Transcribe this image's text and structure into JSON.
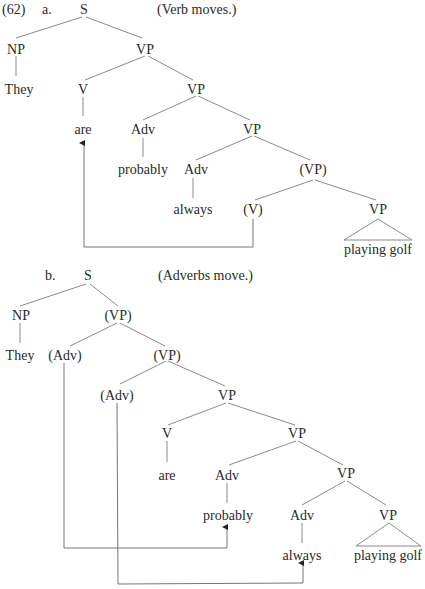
{
  "example_number": "(62)",
  "trees": [
    {
      "label": "a.",
      "caption": "(Verb moves.)",
      "nodes": {
        "S": "S",
        "NP": "NP",
        "They": "They",
        "VP1": "VP",
        "V": "V",
        "are": "are",
        "VP2": "VP",
        "Adv1": "Adv",
        "probably": "probably",
        "VP3": "VP",
        "Adv2": "Adv",
        "always": "always",
        "VP4": "(VP)",
        "Vtrace": "(V)",
        "VP5": "VP",
        "playing_golf": "playing golf"
      },
      "movements": [
        {
          "from": "(V)",
          "to": "are"
        }
      ]
    },
    {
      "label": "b.",
      "caption": "(Adverbs move.)",
      "nodes": {
        "S": "S",
        "NP": "NP",
        "They": "They",
        "VP1": "(VP)",
        "AdvTrace1": "(Adv)",
        "VP2": "(VP)",
        "AdvTrace2": "(Adv)",
        "VP3": "VP",
        "V": "V",
        "are": "are",
        "VP4": "VP",
        "Adv1": "Adv",
        "probably": "probably",
        "VP5": "VP",
        "Adv2": "Adv",
        "always": "always",
        "VP6": "VP",
        "playing_golf": "playing golf"
      },
      "movements": [
        {
          "from": "(Adv)",
          "to": "probably"
        },
        {
          "from": "(Adv)",
          "to": "always"
        }
      ]
    }
  ]
}
